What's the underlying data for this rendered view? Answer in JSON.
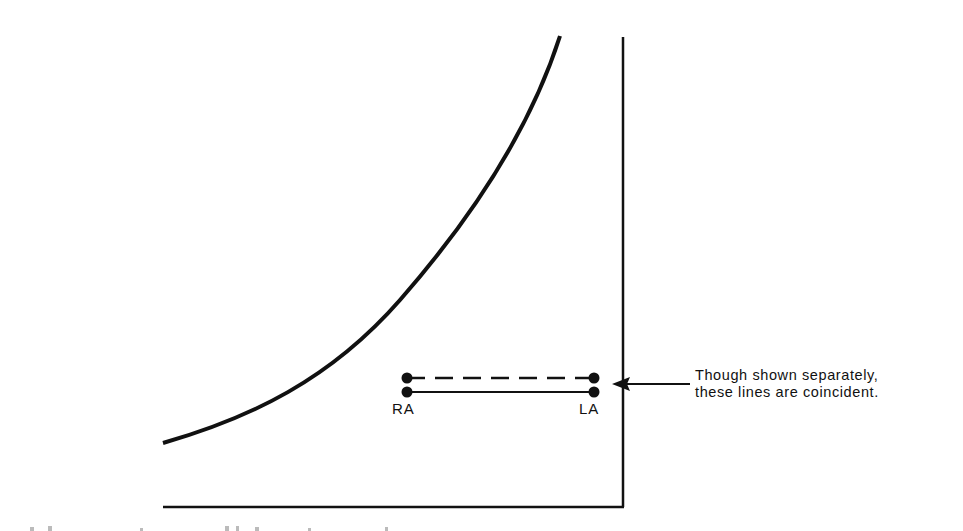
{
  "diagram": {
    "labels": {
      "left_point": "RA",
      "right_point": "LA"
    },
    "annotation": {
      "line1": "Though shown separately,",
      "line2": "these lines are coincident."
    },
    "elements": {
      "curve": "rising curve (increasing steeply to the right)",
      "axes": "vertical line at right, horizontal baseline at bottom",
      "dashed_segment": "RA to LA dashed line (upper)",
      "solid_segment": "RA to LA solid line (lower)",
      "arrow": "arrow pointing left toward the segments"
    },
    "colors": {
      "ink": "#111111",
      "background": "#ffffff"
    }
  }
}
